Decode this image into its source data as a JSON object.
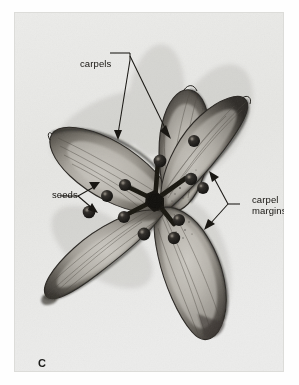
{
  "figure": {
    "plate_letter": "C",
    "background_color": "#e9e9e7",
    "page_color": "#ffffff",
    "ink_color": "#15130f"
  },
  "labels": {
    "carpels": "carpels",
    "seeds": "seeds",
    "carpel_margins_line1": "carpel",
    "carpel_margins_line2": "margins"
  },
  "annotations": [
    {
      "name": "carpels",
      "text": "carpels",
      "leader_count": 2,
      "targets": [
        "upper-left carpel blade",
        "top carpel blade"
      ]
    },
    {
      "name": "seeds",
      "text": "seeds",
      "leader_count": 2,
      "targets": [
        "upper seed sphere",
        "lower seed sphere"
      ]
    },
    {
      "name": "carpel-margins",
      "text": "carpel margins",
      "leader_count": 2,
      "targets": [
        "right carpel margin",
        "lower-right carpel margin"
      ]
    }
  ],
  "structures": {
    "carpel_count": 5,
    "carpel_names": [
      "upper-left carpel",
      "top carpel",
      "right carpel",
      "lower-right carpel",
      "lower-left carpel"
    ],
    "seed_count": 10
  }
}
